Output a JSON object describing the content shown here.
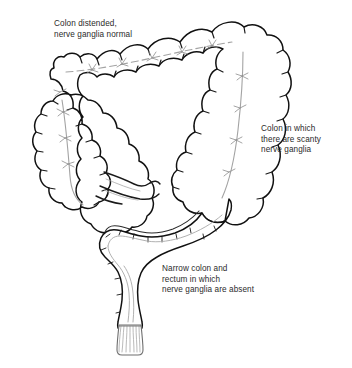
{
  "figure": {
    "width": 352,
    "height": 368,
    "background_color": "#ffffff",
    "style": "black-and-white line drawing"
  },
  "labels": {
    "distended": {
      "line1": "Colon distended,",
      "line2": "nerve ganglia normal",
      "text": "Colon distended,\nnerve ganglia normal",
      "points_to": "transverse-and-ascending-colon"
    },
    "scanty": {
      "line1": "Colon in which",
      "line2": "there are scanty",
      "line3": "nerve ganglia",
      "text": "Colon in which\nthere are scanty\nnerve ganglia",
      "points_to": "descending-colon"
    },
    "narrow": {
      "line1": "Narrow colon and",
      "line2": "rectum in which",
      "line3": "nerve ganglia are absent",
      "text": "Narrow colon and\nrectum in which\nnerve ganglia are absent",
      "points_to": "sigmoid-colon-and-rectum"
    }
  },
  "colors": {
    "outline": "#111111",
    "outline_soft": "#3a3a3a",
    "taenia": "#9a9a9a",
    "ganglia": "#8a8a8a",
    "text": "#2b2b2b",
    "fill": "#ffffff"
  },
  "anatomy": {
    "parts": [
      "cecum",
      "ascending colon",
      "hepatic flexure",
      "transverse colon",
      "splenic flexure",
      "descending colon",
      "sigmoid colon",
      "rectum",
      "anal canal",
      "ileum"
    ]
  }
}
